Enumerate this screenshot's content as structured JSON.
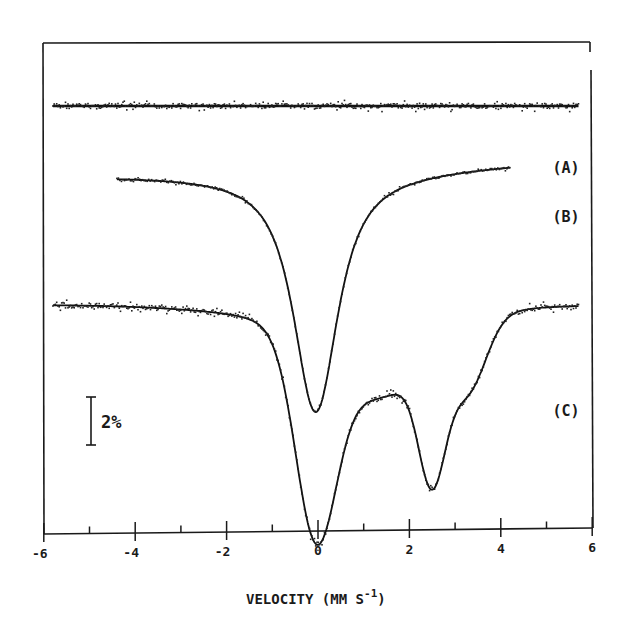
{
  "chart_data": {
    "type": "line",
    "title": "",
    "xlabel": "VELOCITY (MM S^-1)",
    "xlabel_main": "VELOCITY (MM S",
    "xlabel_sup": "-1",
    "xlabel_close": ")",
    "ylabel": "",
    "xlim": [
      -6,
      6
    ],
    "xticks": [
      -6,
      -5,
      -4,
      -3,
      -2,
      -1,
      0,
      1,
      2,
      3,
      4,
      5,
      6
    ],
    "xtick_labels": [
      "-6",
      "-4",
      "-2",
      "0",
      "2",
      "4",
      "6"
    ],
    "xtick_label_values": [
      -6,
      -4,
      -2,
      0,
      2,
      4,
      6
    ],
    "grid": false,
    "legend": "none (curves labeled inline at right)",
    "scale_bar": {
      "label": "2%",
      "value_percent": 2
    },
    "y_units": "relative transmission (%), curves vertically offset",
    "series": [
      {
        "name": "(A)",
        "label": "(A)",
        "x_range": [
          -5.8,
          5.7
        ],
        "description": "flat, no absorption",
        "x": [
          -5.8,
          -4,
          -2,
          0,
          2,
          4,
          5.7
        ],
        "absorption_percent": [
          0,
          0,
          0,
          0,
          0,
          0,
          0
        ]
      },
      {
        "name": "(B)",
        "label": "(B)",
        "x_range": [
          -4.4,
          4.2
        ],
        "description": "single broad absorption line centered near 0 mm/s",
        "x": [
          -4.4,
          -3,
          -2,
          -1,
          -0.5,
          0,
          0.5,
          1,
          2,
          3,
          4.2
        ],
        "absorption_percent": [
          0,
          0.5,
          1.2,
          3.5,
          7.0,
          9.1,
          7.0,
          3.5,
          1.3,
          0.6,
          0.1
        ]
      },
      {
        "name": "(C)",
        "label": "(C)",
        "x_range": [
          -5.8,
          5.7
        ],
        "description": "two resolved absorption minima near 0 and 2.5 mm/s, with shoulder near 3.4 mm/s",
        "x": [
          -5.8,
          -4,
          -2,
          -1,
          -0.5,
          0,
          0.5,
          1.3,
          2,
          2.5,
          3,
          3.4,
          4,
          5,
          5.7
        ],
        "absorption_percent": [
          0,
          0.1,
          0.8,
          2.5,
          5.5,
          7.8,
          5.2,
          3.1,
          4.2,
          6.2,
          4.0,
          3.7,
          2.0,
          0.5,
          0
        ]
      }
    ]
  }
}
